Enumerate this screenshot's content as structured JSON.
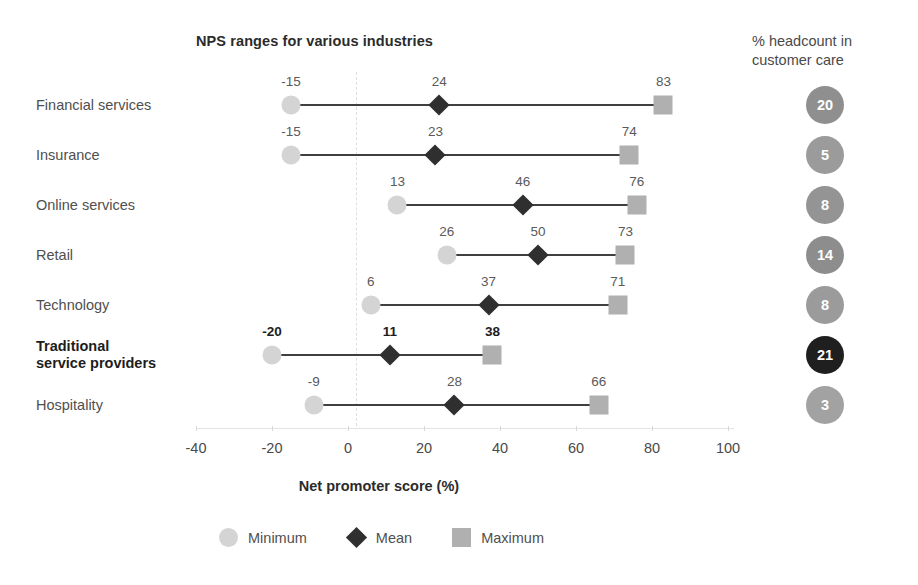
{
  "chart_title": "NPS ranges for various industries",
  "headcount_title": "% headcount in\ncustomer care",
  "x_axis_title": "Net promoter score (%)",
  "legend": {
    "minimum": "Minimum",
    "mean": "Mean",
    "maximum": "Maximum"
  },
  "colors": {
    "minimum": "#d4d4d4",
    "mean": "#2f2f2f",
    "maximum": "#b0b0b0",
    "range_line": "#3f3f3f",
    "bubble_default": "#9a9a9a",
    "bubble_highlight": "#1f1f1f",
    "axis": "#e3e3e3",
    "zero_line": "#dedede",
    "text": "#4f4f4f",
    "text_bold": "#1d1d1d"
  },
  "chart_data": {
    "type": "range-dot-plot",
    "title": "NPS ranges for various industries",
    "xlabel": "Net promoter score (%)",
    "ylabel": "",
    "xlim": [
      -40,
      100
    ],
    "xticks": [
      -40,
      -20,
      0,
      20,
      40,
      60,
      80,
      100
    ],
    "xtick_labels": [
      "-40",
      "-20",
      "0",
      "20",
      "40",
      "60",
      "80",
      "100"
    ],
    "grid": false,
    "zero_reference_line": 0,
    "legend_position": "bottom-center",
    "legend_entries": [
      "Minimum",
      "Mean",
      "Maximum"
    ],
    "series": [
      {
        "name": "Minimum",
        "values": [
          -15,
          -15,
          13,
          26,
          6,
          -20,
          -9
        ]
      },
      {
        "name": "Mean",
        "values": [
          24,
          23,
          46,
          50,
          37,
          11,
          28
        ]
      },
      {
        "name": "Maximum",
        "values": [
          83,
          74,
          76,
          73,
          71,
          38,
          66
        ]
      }
    ],
    "categories": [
      "Financial services",
      "Insurance",
      "Online services",
      "Retail",
      "Technology",
      "Traditional\nservice providers",
      "Hospitality"
    ],
    "secondary_axis": {
      "label": "% headcount in customer care",
      "values": [
        20,
        5,
        8,
        14,
        8,
        21,
        3
      ]
    }
  },
  "rows": [
    {
      "category": "Financial services",
      "highlight": false,
      "min": -15,
      "mean": 24,
      "max": 83,
      "min_label": "-15",
      "mean_label": "24",
      "max_label": "83",
      "headcount": 20,
      "headcount_label": "20",
      "bubble_color": "#8f8f8f"
    },
    {
      "category": "Insurance",
      "highlight": false,
      "min": -15,
      "mean": 23,
      "max": 74,
      "min_label": "-15",
      "mean_label": "23",
      "max_label": "74",
      "headcount": 5,
      "headcount_label": "5",
      "bubble_color": "#9b9b9b"
    },
    {
      "category": "Online services",
      "highlight": false,
      "min": 13,
      "mean": 46,
      "max": 76,
      "min_label": "13",
      "mean_label": "46",
      "max_label": "76",
      "headcount": 8,
      "headcount_label": "8",
      "bubble_color": "#949494"
    },
    {
      "category": "Retail",
      "highlight": false,
      "min": 26,
      "mean": 50,
      "max": 73,
      "min_label": "26",
      "mean_label": "50",
      "max_label": "73",
      "headcount": 14,
      "headcount_label": "14",
      "bubble_color": "#8d8d8d"
    },
    {
      "category": "Technology",
      "highlight": false,
      "min": 6,
      "mean": 37,
      "max": 71,
      "min_label": "6",
      "mean_label": "37",
      "max_label": "71",
      "headcount": 8,
      "headcount_label": "8",
      "bubble_color": "#9b9b9b"
    },
    {
      "category": "Traditional\nservice providers",
      "highlight": true,
      "min": -20,
      "mean": 11,
      "max": 38,
      "min_label": "-20",
      "mean_label": "11",
      "max_label": "38",
      "headcount": 21,
      "headcount_label": "21",
      "bubble_color": "#1f1f1f"
    },
    {
      "category": "Hospitality",
      "highlight": false,
      "min": -9,
      "mean": 28,
      "max": 66,
      "min_label": "-9",
      "mean_label": "28",
      "max_label": "66",
      "headcount": 3,
      "headcount_label": "3",
      "bubble_color": "#a2a2a2"
    }
  ]
}
